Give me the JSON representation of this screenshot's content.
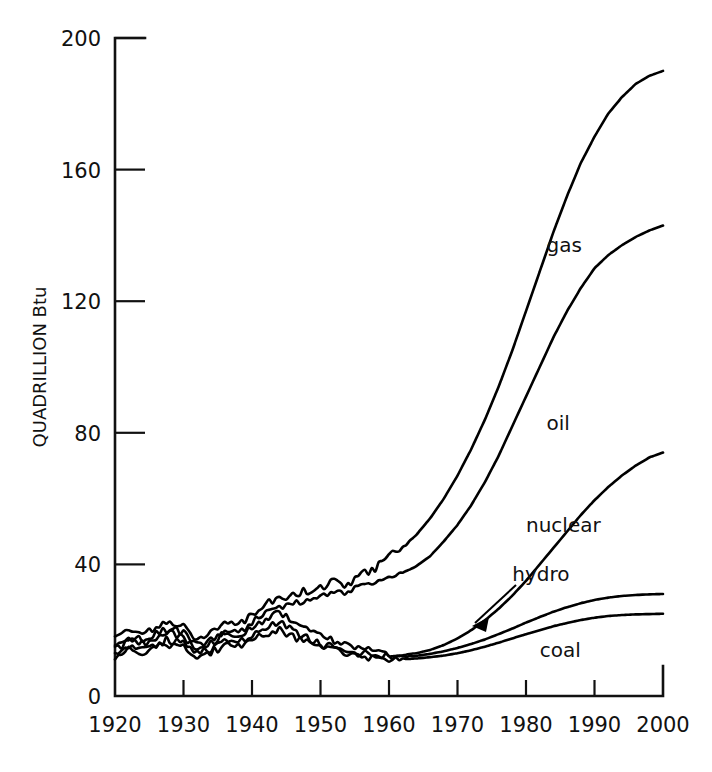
{
  "chart_data": {
    "type": "line",
    "title": "",
    "subtitle": "",
    "xlabel": "",
    "ylabel": "QUADRILLION Btu",
    "xlim": [
      1920,
      2000
    ],
    "ylim": [
      0,
      200
    ],
    "grid": false,
    "legend_position": "inline-right-of-curves",
    "x_ticks": [
      1920,
      1930,
      1940,
      1950,
      1960,
      1970,
      1980,
      1990,
      2000
    ],
    "x_tick_labels": [
      "1920",
      "1930",
      "1940",
      "1950",
      "1960",
      "1970",
      "1980",
      "1990",
      "2000"
    ],
    "y_ticks": [
      0,
      40,
      80,
      120,
      160,
      200
    ],
    "y_tick_labels": [
      "0",
      "40",
      "80",
      "120",
      "160",
      "200"
    ],
    "annotations": [
      {
        "text": "hydro",
        "points_to_series": "hydro",
        "arrow": true,
        "x": 1980,
        "y": 38
      }
    ],
    "x": [
      1920,
      1922,
      1924,
      1926,
      1928,
      1930,
      1932,
      1934,
      1936,
      1938,
      1940,
      1942,
      1944,
      1946,
      1948,
      1950,
      1952,
      1954,
      1956,
      1958,
      1960,
      1962,
      1964,
      1966,
      1968,
      1970,
      1972,
      1974,
      1976,
      1978,
      1980,
      1982,
      1984,
      1986,
      1988,
      1990,
      1992,
      1994,
      1996,
      1998,
      2000
    ],
    "series": [
      {
        "name": "gas",
        "label": "gas",
        "label_x": 1983,
        "label_y": 137,
        "end_value": 190,
        "values": [
          18.0,
          19.5,
          19.0,
          21.0,
          22.5,
          21.0,
          17.0,
          19.0,
          22.0,
          21.5,
          24.5,
          27.5,
          30.0,
          30.5,
          32.0,
          33.0,
          34.5,
          34.0,
          38.0,
          38.5,
          43.0,
          45.0,
          49.0,
          54.0,
          60.0,
          67.0,
          75.0,
          84.0,
          94.0,
          105.0,
          117.0,
          129.0,
          141.0,
          152.0,
          162.0,
          170.0,
          177.0,
          182.0,
          186.0,
          188.5,
          190.0
        ]
      },
      {
        "name": "oil",
        "label": "oil",
        "label_x": 1983,
        "label_y": 83,
        "end_value": 143,
        "values": [
          16.0,
          17.5,
          17.0,
          19.0,
          20.5,
          19.0,
          15.5,
          17.0,
          20.0,
          19.5,
          22.5,
          25.5,
          27.5,
          28.0,
          29.5,
          30.0,
          31.5,
          31.0,
          34.0,
          34.5,
          36.0,
          37.5,
          39.5,
          42.5,
          47.0,
          52.0,
          58.0,
          65.0,
          73.0,
          82.0,
          91.0,
          100.0,
          109.0,
          117.0,
          124.0,
          130.0,
          134.0,
          137.0,
          139.5,
          141.5,
          143.0
        ]
      },
      {
        "name": "nuclear",
        "label": "nuclear",
        "label_x": 1980,
        "label_y": 52,
        "end_value": 74,
        "values": [
          15.0,
          16.5,
          16.0,
          18.0,
          19.5,
          18.0,
          14.5,
          16.0,
          19.0,
          18.0,
          21.0,
          23.5,
          25.0,
          22.0,
          20.0,
          18.0,
          17.0,
          15.5,
          14.5,
          13.5,
          12.5,
          12.5,
          13.0,
          14.0,
          15.5,
          17.5,
          20.0,
          23.0,
          26.5,
          30.5,
          35.0,
          40.0,
          45.0,
          50.0,
          55.0,
          59.5,
          63.5,
          67.0,
          70.0,
          72.5,
          74.0
        ]
      },
      {
        "name": "hydro",
        "label": "hydro",
        "label_x": 1978,
        "label_y": 37,
        "end_value": 31,
        "values": [
          13.5,
          15.0,
          14.5,
          16.0,
          17.0,
          16.0,
          13.0,
          14.5,
          17.0,
          16.5,
          18.5,
          21.0,
          22.5,
          20.0,
          18.0,
          16.0,
          15.0,
          13.8,
          13.0,
          12.3,
          11.8,
          11.9,
          12.2,
          12.8,
          13.6,
          14.6,
          15.8,
          17.2,
          18.8,
          20.5,
          22.3,
          24.0,
          25.6,
          27.0,
          28.2,
          29.2,
          29.9,
          30.4,
          30.7,
          30.9,
          31.0
        ]
      },
      {
        "name": "coal",
        "label": "coal",
        "label_x": 1982,
        "label_y": 14,
        "end_value": 25,
        "values": [
          12.5,
          13.8,
          13.3,
          14.8,
          15.6,
          14.6,
          11.8,
          13.2,
          15.5,
          15.0,
          16.8,
          19.0,
          20.3,
          18.2,
          16.5,
          14.8,
          13.9,
          12.9,
          12.2,
          11.6,
          11.2,
          11.2,
          11.4,
          11.8,
          12.3,
          13.0,
          13.9,
          15.0,
          16.2,
          17.5,
          18.8,
          20.0,
          21.2,
          22.2,
          23.1,
          23.8,
          24.3,
          24.6,
          24.8,
          24.9,
          25.0
        ]
      }
    ]
  }
}
